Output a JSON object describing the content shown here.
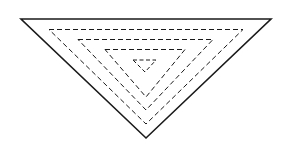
{
  "figure": {
    "canvas": {
      "width": 284,
      "height": 151,
      "background": "#ffffff"
    },
    "stroke_color": "#1a1a1a",
    "triangles": [
      {
        "name": "outer-triangle",
        "style": "solid",
        "stroke_width": 1.6,
        "dash_pattern": "none",
        "points": "21,19 271,19 146,138",
        "left_vertex": [
          21,
          19
        ],
        "right_vertex": [
          271,
          19
        ],
        "apex": [
          146,
          138
        ]
      },
      {
        "name": "dashed-triangle-1",
        "style": "dashed",
        "stroke_width": 1.0,
        "dash_pattern": "5,3",
        "points": "49,29.5 243,29.5 146,124",
        "left_vertex": [
          49,
          29.5
        ],
        "right_vertex": [
          243,
          29.5
        ],
        "apex": [
          146,
          124
        ]
      },
      {
        "name": "dashed-triangle-2",
        "style": "dashed",
        "stroke_width": 1.0,
        "dash_pattern": "5,3",
        "points": "78,39.5 213,39.5 146,110",
        "left_vertex": [
          78,
          39.5
        ],
        "right_vertex": [
          213,
          39.5
        ],
        "apex": [
          146,
          110
        ]
      },
      {
        "name": "dashed-triangle-3",
        "style": "dashed",
        "stroke_width": 1.0,
        "dash_pattern": "5,3",
        "points": "105,49.5 185,49.5 146,97",
        "left_vertex": [
          105,
          49.5
        ],
        "right_vertex": [
          185,
          49.5
        ],
        "apex": [
          146,
          97
        ]
      },
      {
        "name": "dashed-triangle-4",
        "style": "dashed",
        "stroke_width": 1.0,
        "dash_pattern": "4,2.5",
        "points": "133,60 156,60 145,72",
        "left_vertex": [
          133,
          60
        ],
        "right_vertex": [
          156,
          60
        ],
        "apex": [
          145,
          72
        ]
      }
    ]
  }
}
